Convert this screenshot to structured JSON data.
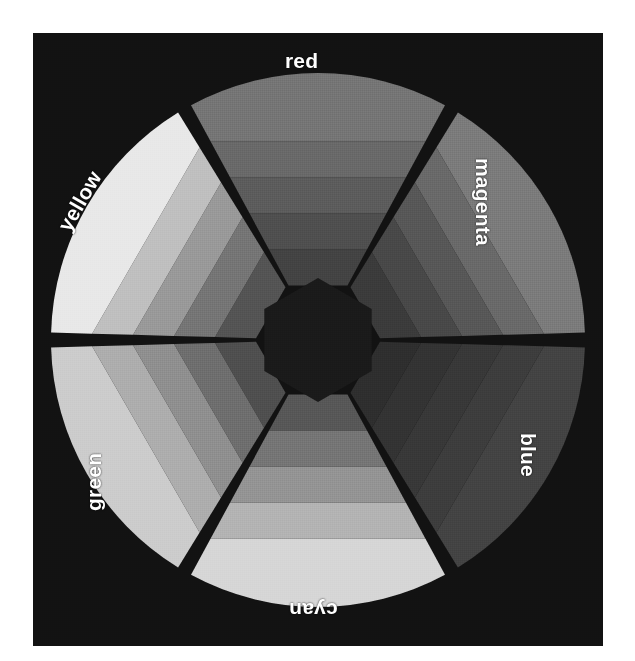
{
  "figure": {
    "background_color": "#ffffff",
    "plate_color": "#121212",
    "label_color": "#ffffff"
  },
  "chart_data": {
    "type": "pie",
    "title": "",
    "subtitle": "",
    "xlabel": "",
    "ylabel": "",
    "legend_position": "around-wheel",
    "grid": false,
    "geometry": {
      "center_x": 285,
      "center_y": 307,
      "outer_radius": 267,
      "inner_radius": 62,
      "band_count": 5,
      "wedge_count": 6,
      "wedge_span_degrees": 60,
      "gap_degrees": 3.2
    },
    "categories": [
      "red",
      "magenta",
      "blue",
      "cyan",
      "green",
      "yellow"
    ],
    "values": [
      60,
      60,
      60,
      60,
      60,
      60
    ],
    "series": [
      {
        "name": "band 1 (innermost)",
        "values": [
          26,
          23,
          18,
          34,
          31,
          33
        ]
      },
      {
        "name": "band 2",
        "values": [
          31,
          28,
          20,
          46,
          43,
          46
        ]
      },
      {
        "name": "band 3",
        "values": [
          36,
          34,
          22,
          58,
          56,
          60
        ]
      },
      {
        "name": "band 4",
        "values": [
          41,
          41,
          24,
          70,
          68,
          75
        ]
      },
      {
        "name": "band 5 (outermost)",
        "values": [
          46,
          48,
          26,
          84,
          80,
          91
        ]
      }
    ],
    "wedges": [
      {
        "label": "red",
        "start_angle": -30,
        "end_angle": 30,
        "band_colors": [
          "#434343",
          "#4f4f4f",
          "#5c5c5c",
          "#696969",
          "#757575"
        ]
      },
      {
        "label": "magenta",
        "start_angle": 30,
        "end_angle": 90,
        "band_colors": [
          "#3b3b3b",
          "#484848",
          "#575757",
          "#696969",
          "#7b7b7b"
        ]
      },
      {
        "label": "blue",
        "start_angle": 90,
        "end_angle": 150,
        "band_colors": [
          "#2e2e2e",
          "#333333",
          "#383838",
          "#3d3d3d",
          "#434343"
        ]
      },
      {
        "label": "cyan",
        "start_angle": 150,
        "end_angle": 210,
        "band_colors": [
          "#575757",
          "#757575",
          "#949494",
          "#b3b3b3",
          "#d6d6d6"
        ]
      },
      {
        "label": "green",
        "start_angle": 210,
        "end_angle": 270,
        "band_colors": [
          "#4f4f4f",
          "#6e6e6e",
          "#8f8f8f",
          "#adadad",
          "#cccccc"
        ]
      },
      {
        "label": "yellow",
        "start_angle": 270,
        "end_angle": 330,
        "band_colors": [
          "#545454",
          "#757575",
          "#999999",
          "#bfbfbf",
          "#e8e8e8"
        ]
      }
    ],
    "hub": {
      "shape": "hexagon",
      "color": "#1a1a1a",
      "radius": 62
    },
    "gap_color": "#141414"
  },
  "labels": {
    "red": "red",
    "magenta": "magenta",
    "blue": "blue",
    "cyan": "cyan",
    "green": "green",
    "yellow": "yellow"
  }
}
